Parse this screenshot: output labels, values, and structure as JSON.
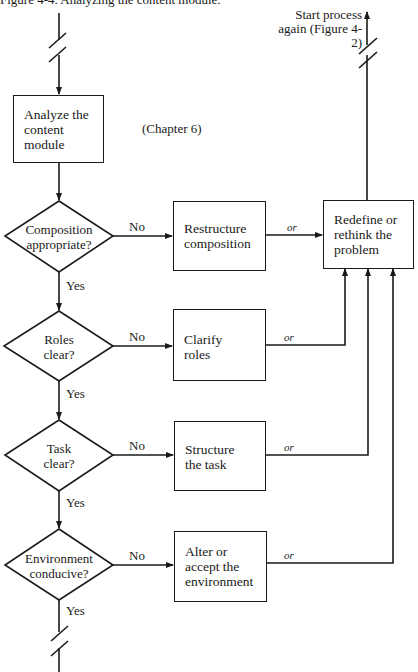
{
  "figure": {
    "title": "Figure 4-4.   Analyzing the content module.",
    "start_label": "Start process again (Figure 4-2)",
    "start_label_lines": [
      "Start process",
      "again (Figure 4-2)"
    ],
    "chapter_note": "(Chapter 6)"
  },
  "nodes": {
    "analyze": {
      "lines": [
        "Analyze the",
        "content",
        "module"
      ]
    },
    "redefine": {
      "lines": [
        "Redefine or",
        "rethink the",
        "problem"
      ]
    }
  },
  "decisions": [
    {
      "lines": [
        "Composition",
        "appropriate?"
      ],
      "no": "No",
      "yes": "Yes",
      "action": {
        "lines": [
          "Restructure",
          "composition"
        ]
      },
      "or": "or"
    },
    {
      "lines": [
        "Roles",
        "clear?"
      ],
      "no": "No",
      "yes": "Yes",
      "action": {
        "lines": [
          "Clarify",
          "roles"
        ]
      },
      "or": "or"
    },
    {
      "lines": [
        "Task",
        "clear?"
      ],
      "no": "No",
      "yes": "Yes",
      "action": {
        "lines": [
          "Structure",
          "the task"
        ]
      },
      "or": "or"
    },
    {
      "lines": [
        "Environment",
        "conducive?"
      ],
      "no": "No",
      "yes": "Yes",
      "action": {
        "lines": [
          "Alter or",
          "accept the",
          "environment"
        ]
      },
      "or": "or"
    }
  ]
}
